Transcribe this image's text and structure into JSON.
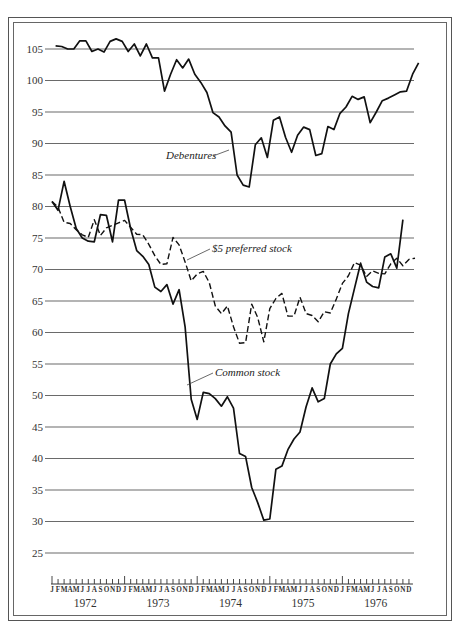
{
  "chart_data": {
    "type": "line",
    "title": "",
    "xlabel": "",
    "ylabel": "",
    "ylim": [
      25,
      105
    ],
    "yticks": [
      105,
      100,
      95,
      90,
      85,
      80,
      75,
      70,
      65,
      60,
      55,
      50,
      45,
      40,
      35,
      30,
      25
    ],
    "grid": true,
    "month_labels": [
      "J",
      "F",
      "M",
      "A",
      "M",
      "J",
      "J",
      "A",
      "S",
      "O",
      "N",
      "D"
    ],
    "years": [
      "1972",
      "1973",
      "1974",
      "1975",
      "1976"
    ],
    "x_range": [
      "Jan 1972",
      "Dec 1976"
    ],
    "series": [
      {
        "name": "Debentures",
        "style": "solid",
        "start_month_index": 0.6,
        "values": [
          105.5,
          105.4,
          105.0,
          105.0,
          106.3,
          106.3,
          104.6,
          105.0,
          104.5,
          106.2,
          106.6,
          106.2,
          104.6,
          105.8,
          103.9,
          105.8,
          103.6,
          103.6,
          98.3,
          101.0,
          103.3,
          102.0,
          103.4,
          101.0,
          99.7,
          98.1,
          94.9,
          94.2,
          92.8,
          91.8,
          85.0,
          83.4,
          83.1,
          89.8,
          90.9,
          87.8,
          93.7,
          94.2,
          91.0,
          88.6,
          91.3,
          92.6,
          92.2,
          88.1,
          88.4,
          92.7,
          92.2,
          94.8,
          95.8,
          97.5,
          97.0,
          97.4,
          93.3,
          95.0,
          96.8,
          97.2,
          97.7,
          98.2,
          98.3,
          101.0,
          102.8
        ]
      },
      {
        "name": "$5 preferred stock",
        "style": "dashed",
        "start_month_index": 0,
        "values": [
          80.8,
          79.9,
          77.5,
          77.3,
          76.3,
          75.5,
          75.1,
          77.9,
          75.4,
          76.6,
          77.0,
          77.4,
          77.8,
          76.7,
          75.6,
          75.5,
          74.0,
          72.2,
          70.8,
          70.9,
          75.1,
          73.9,
          71.2,
          68.2,
          69.3,
          69.7,
          67.9,
          64.2,
          63.0,
          64.2,
          60.9,
          58.3,
          58.4,
          64.5,
          62.4,
          58.5,
          63.8,
          65.4,
          66.2,
          62.6,
          62.6,
          65.6,
          63.0,
          62.7,
          61.7,
          63.3,
          63.1,
          65.3,
          67.8,
          69.0,
          71.1,
          70.7,
          68.9,
          69.8,
          69.4,
          69.3,
          70.9,
          71.8,
          70.6,
          71.6,
          71.8
        ]
      },
      {
        "name": "Common stock",
        "style": "solid",
        "start_month_index": 0,
        "values": [
          80.8,
          79.4,
          84.0,
          80.0,
          76.5,
          75.0,
          74.5,
          74.4,
          78.7,
          78.6,
          74.4,
          81.0,
          81.0,
          76.5,
          73.0,
          72.1,
          70.8,
          67.2,
          66.5,
          67.6,
          64.5,
          66.8,
          60.9,
          49.4,
          46.2,
          50.5,
          50.3,
          49.5,
          48.3,
          49.8,
          48.0,
          40.8,
          40.3,
          35.4,
          33.0,
          30.2,
          30.4,
          38.3,
          38.8,
          41.4,
          43.1,
          44.2,
          48.2,
          51.2,
          49.0,
          49.5,
          55.0,
          56.6,
          57.5,
          63.0,
          67.0,
          71.0,
          68.0,
          67.3,
          67.1,
          72.0,
          72.5,
          70.2,
          77.9
        ]
      }
    ],
    "annotations": [
      {
        "text": "Debentures",
        "target_series": "Debentures"
      },
      {
        "text": "$5 preferred stock",
        "target_series": "$5 preferred stock"
      },
      {
        "text": "Common stock",
        "target_series": "Common stock"
      }
    ]
  }
}
